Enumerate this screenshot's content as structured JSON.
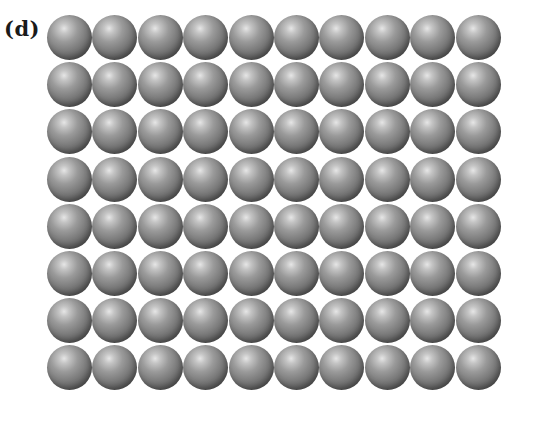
{
  "figure": {
    "panel_label": "(d)",
    "lattice": {
      "description": "Simple square packing of identical spheres",
      "rows": 8,
      "columns": 10,
      "atom_color": "#7a7a7a",
      "highlight_color": "#e6e6e6",
      "shadow_color": "#3e3e3e"
    }
  }
}
